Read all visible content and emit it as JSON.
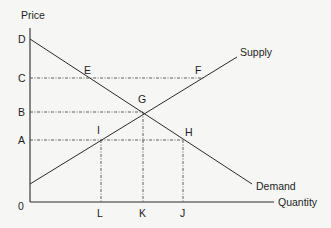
{
  "diagram": {
    "type": "supply-demand",
    "axes": {
      "y_label": "Price",
      "x_label": "Quantity",
      "origin_label": "0"
    },
    "price_levels": [
      {
        "label": "D",
        "y": 39
      },
      {
        "label": "C",
        "y": 78
      },
      {
        "label": "B",
        "y": 112
      },
      {
        "label": "A",
        "y": 140
      }
    ],
    "quantity_levels": [
      {
        "label": "L",
        "x": 101
      },
      {
        "label": "K",
        "x": 143
      },
      {
        "label": "J",
        "x": 183
      }
    ],
    "curves": {
      "supply": {
        "label": "Supply"
      },
      "demand": {
        "label": "Demand"
      }
    },
    "points": [
      {
        "label": "E",
        "x": 88,
        "y": 78
      },
      {
        "label": "F",
        "x": 204,
        "y": 78
      },
      {
        "label": "G",
        "x": 143,
        "y": 112
      },
      {
        "label": "I",
        "x": 101,
        "y": 140
      },
      {
        "label": "H",
        "x": 183,
        "y": 140
      }
    ],
    "colors": {
      "line": "#2a2a2a",
      "background": "#f6f6f4"
    }
  }
}
